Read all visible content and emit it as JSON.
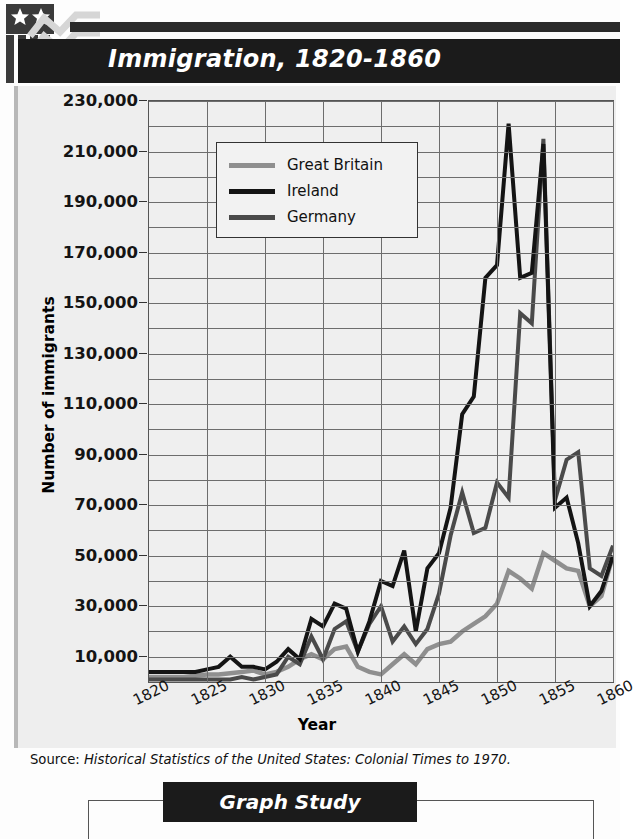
{
  "header": {
    "title": "Immigration, 1820-1860",
    "logo_name": "flag-chart-logo"
  },
  "source": {
    "lead": "Source:",
    "citation": "Historical Statistics of the United States: Colonial Times to 1970."
  },
  "footer": {
    "banner_label": "Graph Study"
  },
  "colors": {
    "great_britain": "#8f8f8f",
    "ireland": "#141414",
    "germany": "#4a4a4a",
    "grid": "#6d6d6d",
    "plot_bg": "#efefef",
    "title_bar": "#1b1b1b"
  },
  "chart_data": {
    "type": "line",
    "title": "Immigration, 1820-1860",
    "xlabel": "Year",
    "ylabel": "Number of immigrants",
    "xlim": [
      1820,
      1860
    ],
    "ylim": [
      0,
      230000
    ],
    "grid": true,
    "legend_position": "upper-left-inside",
    "ytick_labels": [
      "10,000",
      "30,000",
      "50,000",
      "70,000",
      "90,000",
      "110,000",
      "130,000",
      "150,000",
      "170,000",
      "190,000",
      "210,000",
      "230,000"
    ],
    "ytick_values": [
      10000,
      30000,
      50000,
      70000,
      90000,
      110000,
      130000,
      150000,
      170000,
      190000,
      210000,
      230000
    ],
    "xtick_labels": [
      "1820",
      "1825",
      "1830",
      "1835",
      "1840",
      "1845",
      "1850",
      "1855",
      "1860"
    ],
    "xtick_values": [
      1820,
      1825,
      1830,
      1835,
      1840,
      1845,
      1850,
      1855,
      1860
    ],
    "x": [
      1820,
      1821,
      1822,
      1823,
      1824,
      1825,
      1826,
      1827,
      1828,
      1829,
      1830,
      1831,
      1832,
      1833,
      1834,
      1835,
      1836,
      1837,
      1838,
      1839,
      1840,
      1841,
      1842,
      1843,
      1844,
      1845,
      1846,
      1847,
      1848,
      1849,
      1850,
      1851,
      1852,
      1853,
      1854,
      1855,
      1856,
      1857,
      1858,
      1859,
      1860
    ],
    "series": [
      {
        "name": "Great Britain",
        "color": "#8f8f8f",
        "values": [
          2000,
          2000,
          2000,
          2000,
          2500,
          3000,
          3000,
          3500,
          4000,
          4500,
          3000,
          4000,
          6000,
          9000,
          11000,
          9000,
          13000,
          14000,
          6000,
          4000,
          3000,
          7000,
          11000,
          7000,
          13000,
          15000,
          16000,
          20000,
          23000,
          26000,
          31000,
          44000,
          41000,
          37000,
          51000,
          48000,
          45000,
          44000,
          30000,
          34000,
          50000
        ]
      },
      {
        "name": "Ireland",
        "color": "#141414",
        "values": [
          4000,
          4000,
          4000,
          4000,
          4000,
          5000,
          6000,
          10000,
          6000,
          6000,
          5000,
          8000,
          13000,
          9000,
          25000,
          22000,
          31000,
          29000,
          12000,
          24000,
          40000,
          38000,
          52000,
          20000,
          45000,
          51000,
          69000,
          106000,
          113000,
          160000,
          165000,
          221000,
          160000,
          162000,
          213000,
          69000,
          73000,
          55000,
          30000,
          36000,
          50000
        ]
      },
      {
        "name": "Germany",
        "color": "#4a4a4a",
        "values": [
          1000,
          1000,
          1000,
          1000,
          1000,
          1000,
          1000,
          1000,
          2000,
          1000,
          2000,
          3000,
          10000,
          7000,
          18000,
          9000,
          21000,
          24000,
          12000,
          23000,
          30000,
          16000,
          22000,
          15000,
          21000,
          35000,
          58000,
          75000,
          59000,
          61000,
          79000,
          73000,
          146000,
          142000,
          215000,
          72000,
          88000,
          91000,
          45000,
          42000,
          54000
        ]
      }
    ],
    "peaks": [
      {
        "series": "Ireland",
        "year": 1851,
        "value": 221000
      },
      {
        "series": "Ireland",
        "year": 1854,
        "value": 213000
      },
      {
        "series": "Germany",
        "year": 1854,
        "value": 215000
      }
    ]
  }
}
